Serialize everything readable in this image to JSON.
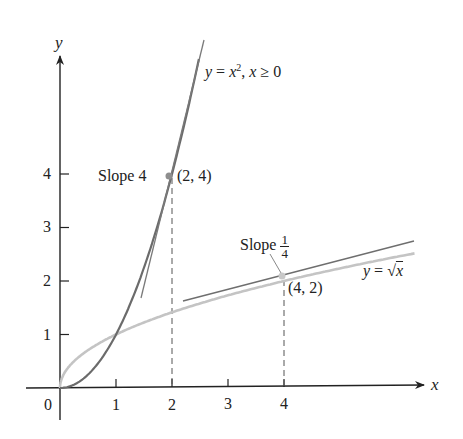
{
  "figure": {
    "axes": {
      "x_label": "x",
      "y_label": "y",
      "origin_label": "0",
      "x_ticks": [
        "1",
        "2",
        "3",
        "4"
      ],
      "y_ticks": [
        "1",
        "2",
        "3",
        "4"
      ]
    },
    "curves": {
      "parabola": {
        "label_prefix": "y = ",
        "label_var": "x",
        "label_exp": "2",
        "label_suffix": ", ",
        "label_cond_var": "x",
        "label_cond": " ≥ 0",
        "color": "#6b6b6b"
      },
      "sqrt": {
        "label_prefix": "y = ",
        "label_sqrt": "√",
        "label_var": "x",
        "color": "#c4c4c4"
      }
    },
    "points": {
      "p1": {
        "label": "(2, 4)",
        "slope_label": "Slope 4"
      },
      "p2": {
        "label": "(4, 2)",
        "slope_label": "Slope",
        "slope_num": "1",
        "slope_den": "4"
      }
    },
    "colors": {
      "axis": "#222222",
      "tangent": "#7a7a7a",
      "dash": "#555555",
      "point": "#9a9a9a"
    }
  },
  "chart_data": {
    "type": "line",
    "title": "",
    "xlabel": "x",
    "ylabel": "y",
    "xlim": [
      0,
      6.5
    ],
    "ylim": [
      0,
      6.5
    ],
    "x_ticks": [
      1,
      2,
      3,
      4
    ],
    "y_ticks": [
      1,
      2,
      3,
      4
    ],
    "grid": false,
    "series": [
      {
        "name": "y = x^2, x >= 0",
        "function": "x^2",
        "x": [
          0,
          0.5,
          1,
          1.5,
          2,
          2.5
        ],
        "values": [
          0,
          0.25,
          1,
          2.25,
          4,
          6.25
        ]
      },
      {
        "name": "y = sqrt(x)",
        "function": "sqrt(x)",
        "x": [
          0,
          1,
          2,
          4,
          6.3
        ],
        "values": [
          0,
          1,
          1.414,
          2,
          2.51
        ]
      },
      {
        "name": "tangent at (2,4)",
        "slope": 4,
        "point": [
          2,
          4
        ]
      },
      {
        "name": "tangent at (4,2)",
        "slope": 0.25,
        "point": [
          4,
          2
        ]
      }
    ],
    "annotations": [
      {
        "text": "Slope 4",
        "at": [
          2,
          4
        ]
      },
      {
        "text": "(2, 4)",
        "at": [
          2,
          4
        ]
      },
      {
        "text": "Slope 1/4",
        "at": [
          4,
          2
        ]
      },
      {
        "text": "(4, 2)",
        "at": [
          4,
          2
        ]
      },
      {
        "text": "y = x^2, x ≥ 0",
        "at": [
          2.6,
          6.2
        ]
      },
      {
        "text": "y = √x",
        "at": [
          6.0,
          2.2
        ]
      }
    ]
  }
}
